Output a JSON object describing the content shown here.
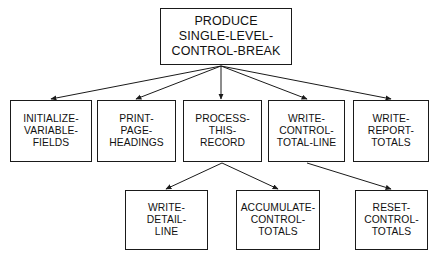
{
  "diagram": {
    "type": "hierarchy-structure-chart",
    "background_color": "#ffffff",
    "line_color": "#1a1a1a",
    "text_color": "#111111",
    "nodes": [
      {
        "id": "produce-single-level-control-break",
        "label": "PRODUCE\nSINGLE-LEVEL-\nCONTROL-BREAK",
        "level": 0,
        "x": 160,
        "y": 8,
        "w": 132,
        "h": 57
      },
      {
        "id": "initialize-variable-fields",
        "label": "INITIALIZE-\nVARIABLE-\nFIELDS",
        "level": 1,
        "x": 10,
        "y": 100,
        "w": 82,
        "h": 62
      },
      {
        "id": "print-page-headings",
        "label": "PRINT-\nPAGE-\nHEADINGS",
        "level": 1,
        "x": 97,
        "y": 100,
        "w": 79,
        "h": 62
      },
      {
        "id": "process-this-record",
        "label": "PROCESS-\nTHIS-\nRECORD",
        "level": 1,
        "x": 183,
        "y": 100,
        "w": 79,
        "h": 62
      },
      {
        "id": "write-control-total-line",
        "label": "WRITE-\nCONTROL-\nTOTAL-LINE",
        "level": 1,
        "x": 268,
        "y": 100,
        "w": 77,
        "h": 62
      },
      {
        "id": "write-report-totals",
        "label": "WRITE-\nREPORT-\nTOTALS",
        "level": 1,
        "x": 353,
        "y": 100,
        "w": 76,
        "h": 62
      },
      {
        "id": "write-detail-line",
        "label": "WRITE-\nDETAIL-\nLINE",
        "level": 2,
        "x": 125,
        "y": 190,
        "w": 83,
        "h": 60
      },
      {
        "id": "accumulate-control-totals",
        "label": "ACCUMULATE-\nCONTROL-\nTOTALS",
        "level": 2,
        "x": 236,
        "y": 190,
        "w": 84,
        "h": 60
      },
      {
        "id": "reset-control-totals",
        "label": "RESET-\nCONTROL-\nTOTALS",
        "level": 2,
        "x": 355,
        "y": 190,
        "w": 73,
        "h": 60
      }
    ],
    "connectors": [
      {
        "from": "produce-single-level-control-break",
        "to": "initialize-variable-fields",
        "x1": 221,
        "y1": 66,
        "x2": 51,
        "y2": 99
      },
      {
        "from": "produce-single-level-control-break",
        "to": "print-page-headings",
        "x1": 221,
        "y1": 66,
        "x2": 136,
        "y2": 99
      },
      {
        "from": "produce-single-level-control-break",
        "to": "process-this-record",
        "x1": 221,
        "y1": 66,
        "x2": 221,
        "y2": 99
      },
      {
        "from": "produce-single-level-control-break",
        "to": "write-control-total-line",
        "x1": 221,
        "y1": 66,
        "x2": 307,
        "y2": 99
      },
      {
        "from": "produce-single-level-control-break",
        "to": "write-report-totals",
        "x1": 221,
        "y1": 66,
        "x2": 391,
        "y2": 99
      },
      {
        "from": "process-this-record",
        "to": "write-detail-line",
        "x1": 222,
        "y1": 163,
        "x2": 166,
        "y2": 189
      },
      {
        "from": "process-this-record",
        "to": "accumulate-control-totals",
        "x1": 222,
        "y1": 163,
        "x2": 278,
        "y2": 189
      },
      {
        "from": "write-control-total-line",
        "to": "reset-control-totals",
        "x1": 307,
        "y1": 163,
        "x2": 391,
        "y2": 189
      }
    ]
  }
}
